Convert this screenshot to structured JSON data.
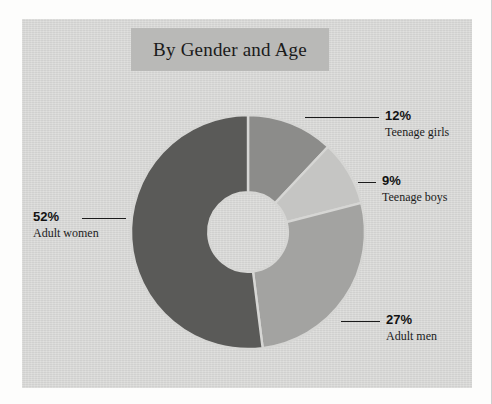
{
  "panel": {
    "background_color": "#d6d6d4",
    "page_background_color": "#fdfdfc"
  },
  "title": {
    "text": "By Gender and Age",
    "band_color": "#b9b9b7"
  },
  "chart_data": {
    "type": "pie",
    "variant": "donut",
    "title": "By Gender and Age",
    "categories": [
      "Teenage girls",
      "Teenage boys",
      "Adult men",
      "Adult women"
    ],
    "values": [
      12,
      9,
      27,
      52
    ],
    "value_labels": [
      "12%",
      "9%",
      "27%",
      "52%"
    ],
    "unit": "percent",
    "total": 100,
    "start_angle_deg": 0,
    "direction": "clockwise",
    "inner_radius_ratio": 0.34,
    "legend": "none",
    "labels": "callout-leader-lines",
    "grid": false,
    "colors": [
      "#8c8c8a",
      "#c5c5c3",
      "#a3a3a1",
      "#5a5a58"
    ],
    "slice_gap_color": "#d6d6d4",
    "slices": [
      {
        "name": "Teenage girls",
        "value": 12,
        "label": "12%",
        "color": "#8c8c8a"
      },
      {
        "name": "Teenage boys",
        "value": 9,
        "label": "9%",
        "color": "#c5c5c3"
      },
      {
        "name": "Adult men",
        "value": 27,
        "label": "27%",
        "color": "#a3a3a1"
      },
      {
        "name": "Adult women",
        "value": 52,
        "label": "52%",
        "color": "#5a5a58"
      }
    ]
  },
  "callouts": {
    "teenage_girls": {
      "percent": "12%",
      "name": "Teenage girls"
    },
    "teenage_boys": {
      "percent": "9%",
      "name": "Teenage boys"
    },
    "adult_men": {
      "percent": "27%",
      "name": "Adult men"
    },
    "adult_women": {
      "percent": "52%",
      "name": "Adult women"
    }
  }
}
